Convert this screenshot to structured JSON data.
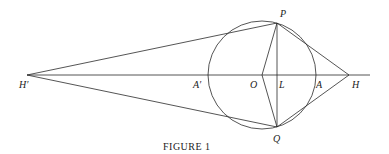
{
  "figure": {
    "caption": "FIGURE 1",
    "labels": {
      "P": "P",
      "Q": "Q",
      "O": "O",
      "L": "L",
      "A": "A",
      "A_prime": "A′",
      "H": "H",
      "H_prime": "H′"
    }
  }
}
